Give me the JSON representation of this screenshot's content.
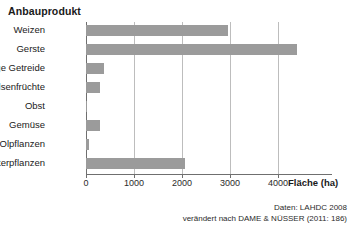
{
  "chart_data": {
    "type": "bar",
    "orientation": "horizontal",
    "title": "Anbauprodukt",
    "xlabel": "Fläche (ha)",
    "ylabel": "Anbauprodukt",
    "categories": [
      "Weizen",
      "Gerste",
      "sonstige Getreide",
      "Hülsenfrüchte",
      "Obst",
      "Gemüse",
      "Olpflanzen",
      "Futterpflanzen"
    ],
    "values": [
      2950,
      4400,
      380,
      300,
      15,
      300,
      60,
      2060
    ],
    "xticks": [
      0,
      1000,
      2000,
      3000,
      4000
    ],
    "xtick_labels": [
      "0",
      "1000",
      "2000",
      "3000",
      "4000"
    ],
    "xlim": [
      0,
      5000
    ],
    "grid": "vertical",
    "legend": "none",
    "bar_color": "#9b9b9b",
    "axis_color": "#6f6f6f",
    "grid_color": "#bdbdbd"
  },
  "footer": {
    "line1": "Daten: LAHDC 2008",
    "line2": "verändert nach DAME & NÜSSER (2011: 186)"
  }
}
